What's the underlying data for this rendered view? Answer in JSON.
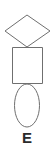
{
  "figure": {
    "label": "E",
    "background_color": "#ffffff",
    "stroke_color": "#6f6f6f",
    "label_color": "#2b2b2b",
    "shapes": [
      {
        "name": "diamond",
        "type": "rhombus",
        "order": 1,
        "position": "top",
        "points": "27,15 50,31 27,47 5,31",
        "center_x": 27,
        "center_y": 31,
        "width": 45,
        "height": 32
      },
      {
        "name": "square",
        "type": "rectangle",
        "order": 2,
        "position": "middle",
        "x": 12,
        "y": 47,
        "width": 31,
        "height": 37
      },
      {
        "name": "ellipse",
        "type": "ellipse",
        "order": 3,
        "position": "bottom",
        "center_x": 27,
        "center_y": 105.5,
        "radius_x": 12.5,
        "radius_y": 21.5
      }
    ]
  }
}
